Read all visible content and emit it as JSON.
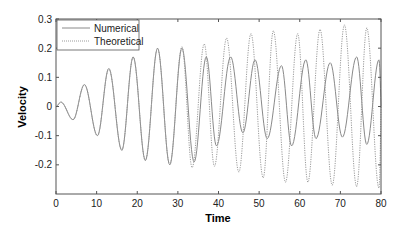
{
  "chart_data": {
    "type": "line",
    "title": "",
    "xlabel": "Time",
    "ylabel": "Velocity",
    "xlim": [
      0,
      80
    ],
    "ylim": [
      -0.3,
      0.3
    ],
    "xticks": [
      0,
      10,
      20,
      30,
      40,
      50,
      60,
      70,
      80
    ],
    "yticks": [
      0.3,
      0.2,
      0.1,
      0,
      -0.1,
      -0.2
    ],
    "ytick_labels": [
      "0.3",
      "0.2",
      "0.1",
      "0",
      "-0.1",
      "-0.2"
    ],
    "grid": false,
    "legend": {
      "position": "upper left",
      "entries": [
        "Numerical",
        "Theoretical"
      ]
    },
    "series": [
      {
        "name": "Numerical",
        "style": "solid",
        "color": "#8a8a8a",
        "peaks_t": [
          1.2,
          7,
          13,
          19,
          25,
          31,
          37,
          43,
          49,
          55.5,
          61.5,
          67.5,
          74,
          79.5
        ],
        "peaks_v": [
          0.015,
          0.075,
          0.13,
          0.17,
          0.2,
          0.2,
          0.17,
          0.17,
          0.16,
          0.14,
          0.16,
          0.15,
          0.17,
          0.16
        ],
        "troughs_t": [
          4.2,
          10.2,
          16.2,
          22,
          28,
          34,
          39.5,
          46,
          52,
          58,
          64,
          70.5,
          76.5
        ],
        "troughs_v": [
          -0.045,
          -0.1,
          -0.15,
          -0.185,
          -0.2,
          -0.19,
          -0.135,
          -0.09,
          -0.11,
          -0.135,
          -0.11,
          -0.105,
          -0.13
        ]
      },
      {
        "name": "Theoretical",
        "style": "dotted",
        "color": "#9a9a9a",
        "peaks_t": [
          1.2,
          7,
          13,
          19,
          25,
          31,
          36.5,
          42,
          48,
          53.5,
          59.5,
          65,
          71,
          76.5
        ],
        "peaks_v": [
          0.015,
          0.075,
          0.13,
          0.17,
          0.2,
          0.205,
          0.215,
          0.235,
          0.25,
          0.26,
          0.25,
          0.265,
          0.28,
          0.27
        ],
        "troughs_t": [
          4.2,
          10.2,
          16.2,
          22,
          28,
          33.5,
          39,
          45,
          51,
          56.5,
          62,
          68,
          74,
          79.5
        ],
        "troughs_v": [
          -0.045,
          -0.1,
          -0.15,
          -0.185,
          -0.2,
          -0.21,
          -0.205,
          -0.225,
          -0.245,
          -0.26,
          -0.26,
          -0.27,
          -0.275,
          -0.28
        ]
      }
    ]
  }
}
